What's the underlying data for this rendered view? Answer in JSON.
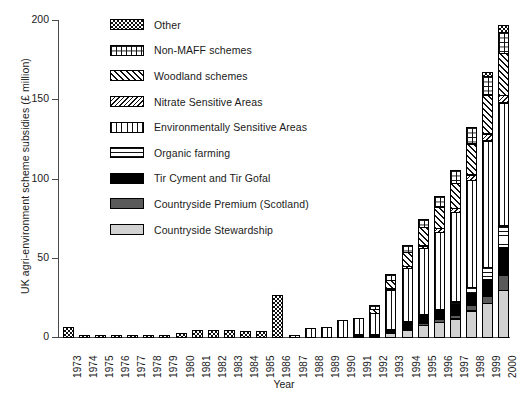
{
  "chart_data": {
    "type": "bar",
    "subtype": "stacked-bar",
    "title": "",
    "xlabel": "Year",
    "ylabel": "UK agri-environment scheme subsidies (£ million)",
    "ylim": [
      0,
      200
    ],
    "yticks": [
      0,
      50,
      100,
      150,
      200
    ],
    "grid": false,
    "legend_position": "top-left-inside",
    "categories": [
      "1973",
      "1974",
      "1975",
      "1976",
      "1977",
      "1978",
      "1979",
      "1980",
      "1981",
      "1982",
      "1983",
      "1984",
      "1985",
      "1986",
      "1987",
      "1988",
      "1989",
      "1990",
      "1991",
      "1992",
      "1993",
      "1994",
      "1995",
      "1996",
      "1997",
      "1998",
      "1999",
      "2000"
    ],
    "series": [
      {
        "name": "Countryside Stewardship",
        "pattern": "light-gray-solid",
        "color": "#d2d2d2",
        "values": [
          0,
          0,
          0,
          0,
          0,
          0,
          0,
          0,
          0,
          0,
          0,
          0,
          0,
          0,
          0,
          0,
          0,
          0,
          0,
          0,
          3,
          5,
          8,
          10,
          12,
          17,
          22,
          30
        ]
      },
      {
        "name": "Countryside Premium (Scotland)",
        "pattern": "dark-gray-solid",
        "color": "#5a5a5a",
        "values": [
          0,
          0,
          0,
          0,
          0,
          0,
          0,
          0,
          0,
          0,
          0,
          0,
          0,
          0,
          0,
          0,
          0,
          0,
          0,
          0,
          0,
          1,
          2,
          2,
          3,
          4,
          5,
          10
        ]
      },
      {
        "name": "Tir Cyment and Tir Gofal",
        "pattern": "black-solid",
        "color": "#000000",
        "values": [
          0,
          0,
          0,
          0,
          0,
          0,
          0,
          0,
          0,
          0,
          0,
          0,
          0,
          0,
          0,
          0,
          0,
          0,
          2,
          2,
          3,
          4,
          5,
          6,
          7,
          8,
          11,
          18
        ]
      },
      {
        "name": "Organic farming",
        "pattern": "horizontal-lines",
        "color": "#ffffff",
        "values": [
          0,
          0,
          0,
          0,
          0,
          0,
          0,
          0,
          0,
          0,
          0,
          0,
          0,
          0,
          0,
          0,
          0,
          0,
          0,
          0,
          0,
          1,
          1,
          1,
          2,
          4,
          8,
          14
        ]
      },
      {
        "name": "Environmentally Sensitive Areas",
        "pattern": "vertical-lines",
        "color": "#ffffff",
        "values": [
          0,
          0,
          0,
          0,
          0,
          0,
          0,
          0,
          0,
          0,
          0,
          0,
          0,
          0,
          2,
          6,
          7,
          11,
          11,
          14,
          25,
          34,
          42,
          49,
          57,
          68,
          80,
          78
        ]
      },
      {
        "name": "Nitrate Sensitive Areas",
        "pattern": "diagonal-back-hatch",
        "color": "#ffffff",
        "values": [
          0,
          0,
          0,
          0,
          0,
          0,
          0,
          0,
          0,
          0,
          0,
          0,
          0,
          0,
          0,
          0,
          0,
          0,
          0,
          0,
          1,
          2,
          2,
          3,
          3,
          4,
          5,
          5
        ]
      },
      {
        "name": "Woodland schemes",
        "pattern": "diagonal-forward-hatch",
        "color": "#ffffff",
        "values": [
          0,
          0,
          0,
          0,
          0,
          0,
          0,
          0,
          0,
          0,
          0,
          0,
          0,
          0,
          0,
          0,
          0,
          0,
          0,
          3,
          6,
          9,
          12,
          14,
          16,
          20,
          25,
          27
        ]
      },
      {
        "name": "Non-MAFF schemes",
        "pattern": "grid-hatch",
        "color": "#ffffff",
        "values": [
          0,
          0,
          0,
          0,
          0,
          0,
          0,
          0,
          0,
          0,
          0,
          0,
          0,
          0,
          0,
          0,
          0,
          0,
          0,
          3,
          4,
          5,
          6,
          7,
          9,
          11,
          12,
          14
        ]
      },
      {
        "name": "Other",
        "pattern": "checkerboard",
        "color": "#ffffff",
        "values": [
          7,
          2,
          2,
          2,
          2,
          2,
          2,
          3,
          5,
          5,
          5,
          4,
          4,
          27,
          0,
          0,
          0,
          0,
          0,
          0,
          0,
          0,
          0,
          0,
          0,
          0,
          3,
          5
        ]
      }
    ],
    "totals": [
      7,
      2,
      2,
      2,
      2,
      2,
      2,
      3,
      5,
      5,
      5,
      4,
      4,
      27,
      2,
      6,
      7,
      11,
      13,
      22,
      42,
      61,
      78,
      92,
      109,
      136,
      171,
      201
    ]
  },
  "legend": {
    "items": [
      {
        "label": "Other",
        "pattern": "checkerboard"
      },
      {
        "label": "Non-MAFF schemes",
        "pattern": "grid-hatch"
      },
      {
        "label": "Woodland schemes",
        "pattern": "diagonal-forward-hatch"
      },
      {
        "label": "Nitrate Sensitive Areas",
        "pattern": "diagonal-back-hatch"
      },
      {
        "label": "Environmentally Sensitive Areas",
        "pattern": "vertical-lines"
      },
      {
        "label": "Organic farming",
        "pattern": "horizontal-lines"
      },
      {
        "label": "Tir Cyment and Tir Gofal",
        "pattern": "black-solid"
      },
      {
        "label": "Countryside Premium (Scotland)",
        "pattern": "dark-gray-solid"
      },
      {
        "label": "Countryside Stewardship",
        "pattern": "light-gray-solid"
      }
    ]
  }
}
